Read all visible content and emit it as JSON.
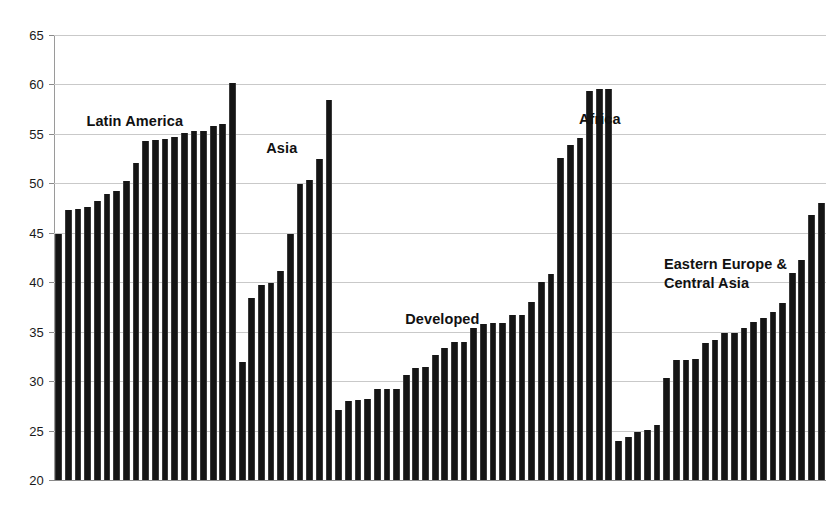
{
  "chart_data": {
    "type": "bar",
    "title": "",
    "subtitle": "",
    "xlabel": "",
    "ylabel": "",
    "ylim": [
      20,
      65
    ],
    "y_ticks": [
      20,
      25,
      30,
      35,
      40,
      45,
      50,
      55,
      60,
      65
    ],
    "y_tick_labels": [
      "20",
      "25",
      "30",
      "35",
      "40",
      "45",
      "50",
      "55",
      "60",
      "65"
    ],
    "grid": "horizontal",
    "legend": "none",
    "bar_color": "#151515",
    "background_color": "#ffffff",
    "groups": [
      {
        "name": "Latin America",
        "label": "Latin America",
        "label_x_pct": 4.2,
        "label_y_value": 57.2,
        "values": [
          44.9,
          47.3,
          47.4,
          47.6,
          48.2,
          48.9,
          49.2,
          50.2,
          52.1,
          54.3,
          54.4,
          54.5,
          54.7,
          55.1,
          55.3,
          55.3,
          55.8,
          56.0,
          60.1
        ]
      },
      {
        "name": "Asia",
        "label": "Asia",
        "label_x_pct": 27.5,
        "label_y_value": 54.5,
        "values": [
          31.9,
          38.4,
          39.7,
          39.9,
          41.1,
          44.9,
          49.9,
          50.3,
          52.5,
          58.4
        ]
      },
      {
        "name": "Developed",
        "label": "Developed",
        "label_x_pct": 45.5,
        "label_y_value": 37.2,
        "values": [
          27.1,
          28.0,
          28.1,
          28.2,
          29.2,
          29.2,
          29.2,
          30.6,
          31.3,
          31.4,
          32.6,
          33.3,
          34.0,
          34.0,
          35.4,
          35.8,
          35.9,
          35.9,
          36.7,
          36.7,
          38.0
        ]
      },
      {
        "name": "Africa",
        "label": "Africa",
        "label_x_pct": 68.0,
        "label_y_value": 57.4,
        "values": [
          40.0,
          40.8,
          52.6,
          53.9,
          54.6,
          59.3,
          59.5,
          59.5
        ]
      },
      {
        "name": "Eastern Europe & Central Asia",
        "label": "Eastern Europe &\nCentral Asia",
        "label_x_pct": 79.0,
        "label_y_value": 42.8,
        "values": [
          23.9,
          24.4,
          24.9,
          25.1,
          25.6,
          30.3,
          32.1,
          32.1,
          32.2,
          33.9,
          34.2,
          34.9,
          34.9,
          35.4,
          36.0,
          36.4,
          37.0,
          37.9,
          40.9,
          42.2,
          46.8,
          48.0
        ]
      }
    ]
  }
}
